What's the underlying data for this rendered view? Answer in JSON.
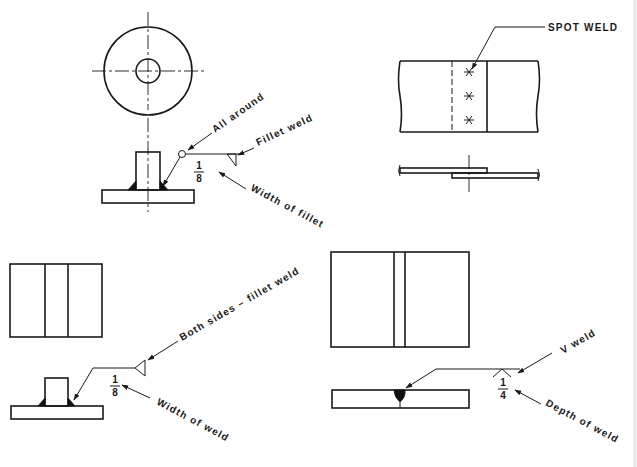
{
  "figure": {
    "panels": [
      {
        "id": "fillet-all-around",
        "labels": {
          "all_around": "All around",
          "fillet_weld": "Fillet weld",
          "width_of_fillet": "Width of fillet",
          "size_numerator": "1",
          "size_denominator": "8"
        }
      },
      {
        "id": "spot-weld",
        "labels": {
          "spot_weld": "SPOT WELD"
        },
        "spot_count": 3
      },
      {
        "id": "fillet-both-sides",
        "labels": {
          "both_sides": "Both sides – fillet weld",
          "width_of_weld": "Width of weld",
          "size_numerator": "1",
          "size_denominator": "8"
        }
      },
      {
        "id": "v-weld",
        "labels": {
          "v_weld": "V weld",
          "depth_of_weld": "Depth of weld",
          "size_numerator": "1",
          "size_denominator": "4"
        }
      }
    ]
  },
  "colors": {
    "ink": "#1a1a1a",
    "background": "#ffffff"
  }
}
